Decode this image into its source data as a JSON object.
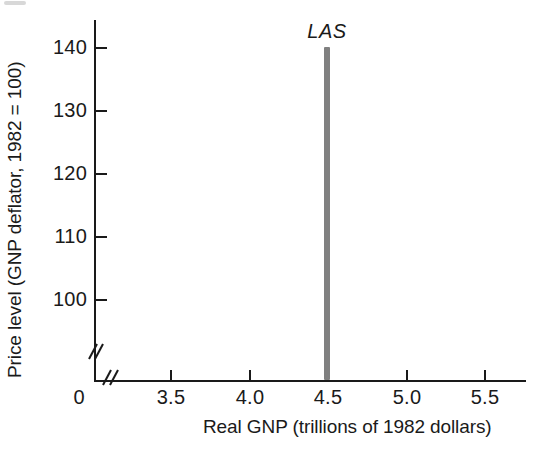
{
  "chart_data": {
    "type": "line",
    "title": "",
    "xlabel": "Real GNP (trillions of 1982 dollars)",
    "ylabel": "Price level (GNP deflator, 1982 = 100)",
    "xlim": [
      3.2,
      5.8
    ],
    "ylim": [
      95,
      143
    ],
    "grid": false,
    "legend_position": "none",
    "origin_label": "0",
    "axis_break_x": true,
    "axis_break_y": true,
    "xticks": [
      3.5,
      4.0,
      4.5,
      5.0,
      5.5
    ],
    "xticklabels": [
      "3.5",
      "4.0",
      "4.5",
      "5.0",
      "5.5"
    ],
    "yticks": [
      100,
      110,
      120,
      130,
      140
    ],
    "yticklabels": [
      "100",
      "110",
      "120",
      "130",
      "140"
    ],
    "series": [
      {
        "name": "LAS",
        "label": "LAS",
        "style": "vertical-line",
        "color": "#808080",
        "linewidth": 6,
        "x": [
          4.5,
          4.5
        ],
        "y": [
          95,
          140
        ],
        "annotation": "LAS",
        "annotation_x": 4.5,
        "annotation_y": 143
      }
    ],
    "annotations": [
      {
        "text": "LAS",
        "x": 4.5,
        "y": 143,
        "italic": true
      }
    ]
  },
  "axes": {
    "y_title": "Price level (GNP deflator, 1982 = 100)",
    "x_title": "Real GNP (trillions of 1982 dollars)",
    "origin": "0",
    "y_ticks": [
      {
        "value": 140,
        "label": "140",
        "top": 47
      },
      {
        "value": 130,
        "label": "130",
        "top": 110
      },
      {
        "value": 120,
        "label": "120",
        "top": 173
      },
      {
        "value": 110,
        "label": "110",
        "top": 236
      },
      {
        "value": 100,
        "label": "100",
        "top": 299
      }
    ],
    "x_ticks": [
      {
        "value": 3.5,
        "label": "3.5",
        "left": 170
      },
      {
        "value": 4.0,
        "label": "4.0",
        "left": 249
      },
      {
        "value": 4.5,
        "label": "4.5",
        "left": 327
      },
      {
        "value": 5.0,
        "label": "5.0",
        "left": 406
      },
      {
        "value": 5.5,
        "label": "5.5",
        "left": 484
      }
    ]
  },
  "curve": {
    "label": "LAS",
    "color": "#808080",
    "left": 324,
    "top": 47,
    "height": 333,
    "label_left": 327,
    "label_top": 20
  }
}
